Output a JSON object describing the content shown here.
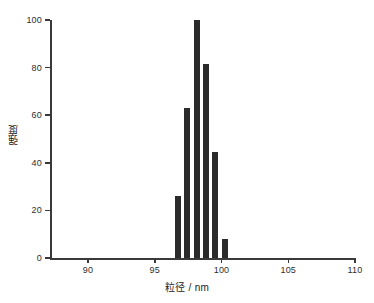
{
  "chart_data": {
    "type": "bar",
    "title": "",
    "subtitle": "",
    "xlabel": "粒径 / nm",
    "ylabel": "强度",
    "xlim": [
      87.5,
      110
    ],
    "ylim": [
      0,
      100
    ],
    "grid": false,
    "legend": "none",
    "x_ticks": [
      90,
      95,
      100,
      105,
      110
    ],
    "x_tick_labels": [
      "90",
      "95",
      "100",
      "105",
      "110"
    ],
    "y_ticks": [
      0,
      20,
      40,
      60,
      80,
      100
    ],
    "y_tick_labels": [
      "0",
      "20",
      "40",
      "60",
      "80",
      "100"
    ],
    "bar_width_units": 0.45,
    "x": [
      96.75,
      97.45,
      98.15,
      98.85,
      99.55,
      100.25
    ],
    "categories": [
      "96.75",
      "97.45",
      "98.15",
      "98.85",
      "99.55",
      "100.25"
    ],
    "values": [
      26,
      63,
      100,
      81.5,
      44.5,
      8
    ],
    "series": [
      {
        "name": "强度",
        "color": "#2b2b2b",
        "values": [
          26,
          63,
          100,
          81.5,
          44.5,
          8
        ]
      }
    ]
  },
  "axes": {
    "x_title": "粒径 / nm",
    "y_title": "强度"
  },
  "colors": {
    "bar": "#2b2b2b",
    "axis": "#3a3a3a",
    "text": "#2e2e2e",
    "background": "#ffffff"
  }
}
